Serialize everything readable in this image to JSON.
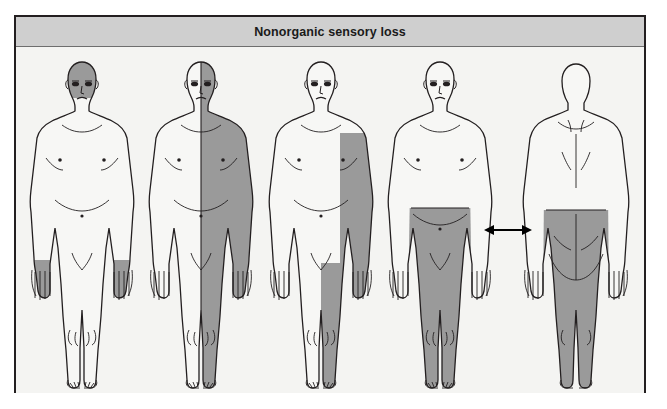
{
  "panel": {
    "title": "Nonorganic sensory loss",
    "header_bg": "#cfcfcf",
    "border_color": "#231f20",
    "stage_bg": "#f4f4f2"
  },
  "palette": {
    "skin_unshaded": "#f7f7f5",
    "sensory_loss_shading": "#9a9a9a",
    "outline": "#231f20",
    "arrow": "#000000",
    "title_text": "#1a1a1a"
  },
  "figures": [
    {
      "index": 1,
      "view": "anterior",
      "name": "head-and-glove-distribution",
      "caption": "",
      "shaded_regions": [
        "head",
        "face",
        "left hand",
        "right hand"
      ],
      "pattern": "glove distribution with facial involvement"
    },
    {
      "index": 2,
      "view": "anterior",
      "name": "hemisensory-loss",
      "caption": "",
      "shaded_regions": [
        "entire right half of body",
        "right side of face",
        "right arm",
        "right hand",
        "right leg",
        "right foot"
      ],
      "pattern": "hemisensory loss splitting exactly at the midline"
    },
    {
      "index": 3,
      "view": "anterior",
      "name": "ipsilateral-arm-and-leg",
      "caption": "",
      "shaded_regions": [
        "right arm",
        "right hand",
        "right leg",
        "right foot"
      ],
      "pattern": "ipsilateral arm and leg, face spared"
    },
    {
      "index": 4,
      "view": "anterior",
      "name": "waist-down-anterior",
      "caption": "",
      "shaded_regions": [
        "trunk below waist",
        "both legs",
        "both feet"
      ],
      "pattern": "sharp horizontal sensory level at the waist"
    },
    {
      "index": 5,
      "view": "posterior",
      "name": "waist-down-posterior",
      "caption": "",
      "shaded_regions": [
        "trunk below waist",
        "buttocks",
        "both legs"
      ],
      "pattern": "sharp horizontal sensory level at the waist, back view"
    }
  ],
  "annotations": {
    "arrow": {
      "name": "double-headed-arrow",
      "label": "",
      "meaning": "links the anterior and posterior waist-level views",
      "direction": "both"
    }
  }
}
